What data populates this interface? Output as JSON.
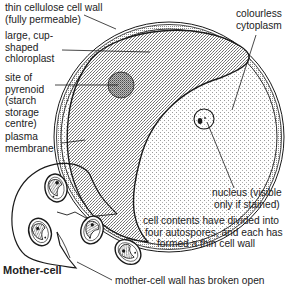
{
  "diagram": {
    "labels": {
      "cell_wall": [
        "thin cellulose cell wall",
        "(fully permeable)"
      ],
      "chloroplast": [
        "large, cup-",
        "shaped",
        "chloroplast"
      ],
      "pyrenoid": [
        "site of",
        "pyrenoid",
        "(starch",
        "storage",
        "centre)"
      ],
      "plasma_membrane": [
        "plasma",
        "membrane"
      ],
      "cytoplasm": [
        "colourless",
        "cytoplasm"
      ],
      "nucleus": [
        "nucleus (visible",
        "only if stained)"
      ],
      "autospores": [
        "cell contents have divided into",
        "four autospores, and each has",
        "formed a thin cell wall"
      ],
      "mother_cell": "Mother-cell",
      "mother_wall": "mother-cell wall has broken open"
    },
    "colors": {
      "ink": "#1a1a1a",
      "stipple_dark": "#9a9a9a",
      "stipple_light": "#d4d4d4",
      "background": "#ffffff"
    }
  }
}
